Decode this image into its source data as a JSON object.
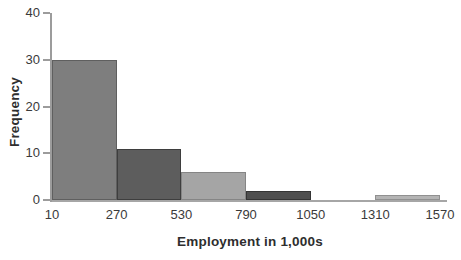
{
  "figure": {
    "background": "#ffffff",
    "axis_color": "#9c9c9c",
    "text_color": "#3a3a3a",
    "title_color": "#2e2e2e"
  },
  "chart_data": {
    "type": "bar",
    "subtype": "histogram",
    "title": "",
    "xlabel": "Employment in 1,000s",
    "ylabel": "Frequency",
    "bin_edges": [
      10,
      270,
      530,
      790,
      1050,
      1310,
      1570
    ],
    "bin_width": 260,
    "frequencies": [
      30,
      11,
      6,
      2,
      0,
      1
    ],
    "x_tick_labels": [
      "10",
      "270",
      "530",
      "790",
      "1050",
      "1310",
      "1570"
    ],
    "y_ticks": [
      0,
      10,
      20,
      30,
      40
    ],
    "ylim": [
      0,
      40
    ],
    "grid": false,
    "legend": "none",
    "bar_fill_colors": [
      "#7e7e7e",
      "#5d5d5d",
      "#a5a5a5",
      "#4f4f4f",
      "#9e9e9e",
      "#b4b4b4"
    ],
    "bar_border_colors": [
      "#5f5f5f",
      "#3e3e3e",
      "#858585",
      "#353535",
      "#808080",
      "#909090"
    ]
  }
}
